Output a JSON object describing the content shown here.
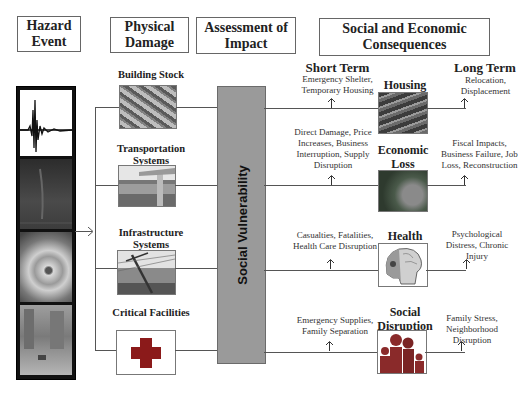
{
  "headers": {
    "hazard": "Hazard Event",
    "physical": "Physical Damage",
    "assessment": "Assessment of Impact",
    "consequences": "Social and Economic Consequences"
  },
  "hazard_images": [
    {
      "name": "seismogram-image"
    },
    {
      "name": "tornado-image"
    },
    {
      "name": "hurricane-image"
    },
    {
      "name": "flood-image"
    }
  ],
  "physical_damage": [
    {
      "label": "Building Stock",
      "image": "collapsed-building-image"
    },
    {
      "label": "Transportation Systems",
      "image": "collapsed-highway-image"
    },
    {
      "label": "Infrastructure Systems",
      "image": "fallen-power-pole-image"
    },
    {
      "label": "Critical Facilities",
      "image": "red-cross-icon"
    }
  ],
  "social_vulnerability": "Social Vulnerability",
  "terms": {
    "short": "Short Term",
    "long": "Long Term"
  },
  "consequences": [
    {
      "label": "Housing",
      "short_term": "Emergency Shelter, Temporary Housing",
      "long_term": "Relocation, Displacement",
      "image": "damaged-house-image"
    },
    {
      "label": "Economic Loss",
      "short_term": "Direct Damage, Price Increases, Business Interruption, Supply Disruption",
      "long_term": "Fiscal Impacts, Business Failure, Job Loss, Reconstruction",
      "image": "dollar-bill-image"
    },
    {
      "label": "Health",
      "short_term": "Casualties, Fatalities, Health Care Disruption",
      "long_term": "Psychological Distress, Chronic Injury",
      "image": "skull-brain-image"
    },
    {
      "label": "Social Disruption",
      "short_term": "Emergency Supplies, Family Separation",
      "long_term": "Family Stress, Neighborhood Disruption",
      "image": "family-icon"
    }
  ],
  "colors": {
    "vulnerability_bar": "#9a9a9a",
    "critical_cross": "#8b1a1a",
    "family_icon": "#8a2a2a",
    "line": "#555555"
  }
}
